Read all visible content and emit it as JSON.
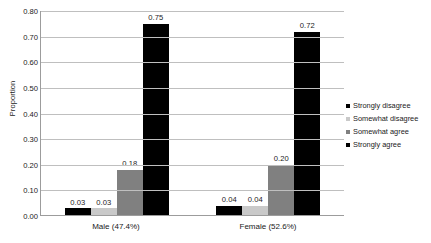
{
  "chart_data": {
    "type": "bar",
    "title": "",
    "xlabel": "",
    "ylabel": "Proportion",
    "ylim": [
      0,
      0.8
    ],
    "ytick_step": 0.1,
    "yticks": [
      "0.80",
      "0.70",
      "0.60",
      "0.50",
      "0.40",
      "0.30",
      "0.20",
      "0.10",
      "0.00"
    ],
    "ytick_values": [
      0.8,
      0.7,
      0.6,
      0.5,
      0.4,
      0.3,
      0.2,
      0.1,
      0.0
    ],
    "grid": true,
    "legend_position": "right",
    "categories": [
      "Male (47.4%)",
      "Female (52.6%)"
    ],
    "series": [
      {
        "name": "Strongly disagree",
        "color": "#000000",
        "values": [
          0.03,
          0.04
        ],
        "labels": [
          "0.03",
          "0.04"
        ]
      },
      {
        "name": "Somewhat disagree",
        "color": "#c9c9c9",
        "values": [
          0.03,
          0.04
        ],
        "labels": [
          "0.03",
          "0.04"
        ]
      },
      {
        "name": "Somewhat agree",
        "color": "#808080",
        "values": [
          0.18,
          0.2
        ],
        "labels": [
          "0.18",
          "0.20"
        ]
      },
      {
        "name": "Strongly agree",
        "color": "#000000",
        "values": [
          0.75,
          0.72
        ],
        "labels": [
          "0.75",
          "0.72"
        ]
      }
    ]
  }
}
